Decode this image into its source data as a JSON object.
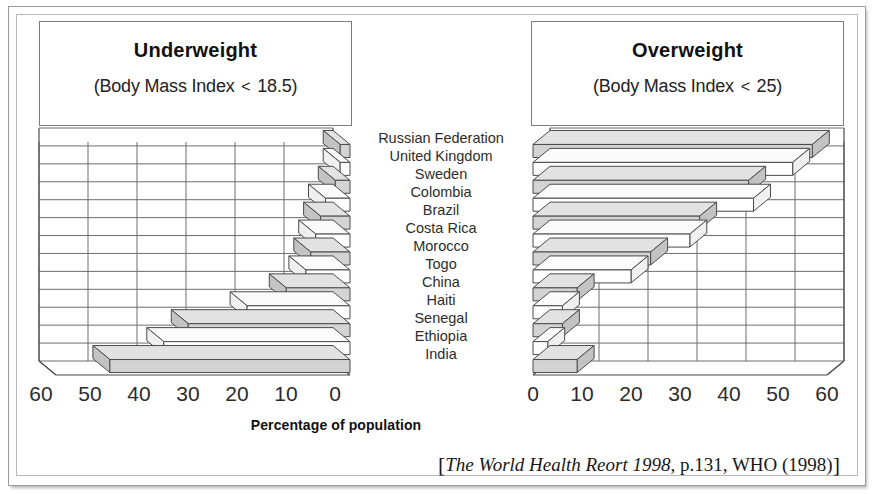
{
  "figure": {
    "axis_title": "Percentage of population",
    "source": {
      "open_bracket": "[",
      "italic_part": "The World Health Reort 1998",
      "rest": ", p.131, WHO (1998)",
      "close_bracket": "]"
    }
  },
  "panels": {
    "left": {
      "title": "Underweight",
      "subtitle_pre": "(Body Mass Index ",
      "subtitle_op": "<",
      "subtitle_post": " 18.5)",
      "ticks": [
        "60",
        "50",
        "40",
        "30",
        "20",
        "10",
        "0"
      ],
      "direction": "right-to-left"
    },
    "right": {
      "title": "Overweight",
      "subtitle_pre": "(Body Mass Index ",
      "subtitle_op": "<",
      "subtitle_post": " 25)",
      "ticks": [
        "0",
        "10",
        "20",
        "30",
        "40",
        "50",
        "60"
      ],
      "direction": "left-to-right"
    }
  },
  "chart_data": {
    "type": "bar",
    "orientation": "horizontal",
    "xlabel": "Percentage of population",
    "ylabel": "",
    "xlim": [
      0,
      60
    ],
    "grid": true,
    "legend": "none",
    "categories": [
      "Russian Federation",
      "United Kingdom",
      "Sweden",
      "Colombia",
      "Brazil",
      "Costa Rica",
      "Morocco",
      "Togo",
      "China",
      "Haiti",
      "Senegal",
      "Ethiopia",
      "India"
    ],
    "series": [
      {
        "name": "Underweight (Body Mass Index < 18.5)",
        "panel": "left",
        "values": [
          2,
          2,
          3,
          5,
          6,
          7,
          8,
          9,
          13,
          21,
          33,
          38,
          49
        ]
      },
      {
        "name": "Overweight (Body Mass Index < 25)",
        "panel": "right",
        "values": [
          57,
          53,
          44,
          45,
          34,
          32,
          24,
          20,
          9,
          6,
          6,
          3,
          9
        ]
      }
    ]
  }
}
